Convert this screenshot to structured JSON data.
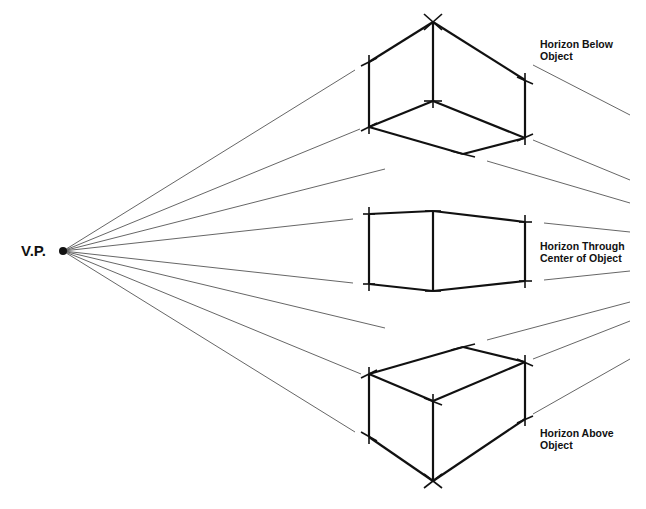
{
  "vanishing_point": {
    "label": "V.P.",
    "x": 63,
    "y": 251
  },
  "colors": {
    "ink": "#111111",
    "guide": "#555555",
    "background": "#ffffff"
  },
  "labels": {
    "top": {
      "line1": "Horizon Below",
      "line2": "Object"
    },
    "middle": {
      "line1": "Horizon Through",
      "line2": "Center of Object"
    },
    "bottom": {
      "line1": "Horizon Above",
      "line2": "Object"
    }
  },
  "objects": [
    {
      "name": "box-horizon-below",
      "edges": [
        [
          369,
          62,
          433,
          22
        ],
        [
          433,
          22,
          525,
          80
        ],
        [
          433,
          22,
          433,
          101
        ],
        [
          369,
          62,
          369,
          127
        ],
        [
          525,
          80,
          525,
          138
        ],
        [
          369,
          127,
          433,
          101
        ],
        [
          433,
          101,
          525,
          138
        ],
        [
          369,
          127,
          463,
          154
        ],
        [
          463,
          154,
          525,
          138
        ]
      ],
      "ticks": [
        [
          424,
          14,
          442,
          30
        ],
        [
          424,
          30,
          442,
          14
        ],
        [
          361,
          66,
          377,
          58
        ],
        [
          369,
          55,
          369,
          69
        ],
        [
          361,
          131,
          377,
          123
        ],
        [
          369,
          120,
          369,
          134
        ],
        [
          424,
          101,
          442,
          101
        ],
        [
          433,
          94,
          433,
          108
        ],
        [
          517,
          77,
          533,
          84
        ],
        [
          525,
          73,
          525,
          87
        ],
        [
          517,
          141,
          533,
          134
        ],
        [
          525,
          131,
          525,
          145
        ],
        [
          451,
          151,
          475,
          157
        ]
      ]
    },
    {
      "name": "box-horizon-through-center",
      "edges": [
        [
          369,
          214,
          433,
          211
        ],
        [
          433,
          211,
          525,
          222
        ],
        [
          369,
          284,
          433,
          291
        ],
        [
          433,
          291,
          525,
          281
        ],
        [
          369,
          214,
          369,
          284
        ],
        [
          433,
          211,
          433,
          291
        ],
        [
          525,
          222,
          525,
          281
        ]
      ],
      "ticks": [
        [
          363,
          214,
          375,
          214
        ],
        [
          369,
          207,
          369,
          221
        ],
        [
          363,
          284,
          375,
          284
        ],
        [
          369,
          277,
          369,
          291
        ],
        [
          425,
          211,
          441,
          211
        ],
        [
          425,
          291,
          441,
          291
        ],
        [
          519,
          222,
          532,
          222
        ],
        [
          525,
          215,
          525,
          229
        ],
        [
          519,
          281,
          532,
          281
        ],
        [
          525,
          274,
          525,
          288
        ]
      ]
    },
    {
      "name": "box-horizon-above",
      "edges": [
        [
          369,
          374,
          463,
          347
        ],
        [
          463,
          347,
          525,
          362
        ],
        [
          369,
          374,
          433,
          401
        ],
        [
          433,
          401,
          525,
          362
        ],
        [
          369,
          374,
          369,
          437
        ],
        [
          433,
          401,
          433,
          481
        ],
        [
          525,
          362,
          525,
          419
        ],
        [
          369,
          437,
          433,
          481
        ],
        [
          433,
          481,
          525,
          419
        ]
      ],
      "ticks": [
        [
          451,
          350,
          475,
          344
        ],
        [
          361,
          378,
          377,
          370
        ],
        [
          369,
          367,
          369,
          381
        ],
        [
          424,
          398,
          442,
          405
        ],
        [
          433,
          394,
          433,
          408
        ],
        [
          517,
          359,
          533,
          366
        ],
        [
          525,
          355,
          525,
          369
        ],
        [
          361,
          432,
          377,
          441
        ],
        [
          369,
          430,
          369,
          444
        ],
        [
          424,
          474,
          442,
          488
        ],
        [
          424,
          488,
          442,
          474
        ],
        [
          517,
          423,
          533,
          416
        ],
        [
          525,
          412,
          525,
          426
        ]
      ]
    }
  ],
  "guide_lines": [
    [
      63,
      251,
      355,
      70
    ],
    [
      63,
      251,
      360,
      129
    ],
    [
      63,
      251,
      385,
      169
    ],
    [
      63,
      251,
      353,
      219
    ],
    [
      63,
      251,
      353,
      283
    ],
    [
      63,
      251,
      385,
      328
    ],
    [
      63,
      251,
      361,
      374
    ],
    [
      63,
      251,
      355,
      432
    ],
    [
      533,
      65,
      630,
      115
    ],
    [
      533,
      140,
      630,
      180
    ],
    [
      487,
      161,
      630,
      203
    ],
    [
      544,
      223,
      630,
      232
    ],
    [
      544,
      280,
      630,
      271
    ],
    [
      487,
      340,
      630,
      302
    ],
    [
      533,
      359,
      630,
      321
    ],
    [
      533,
      414,
      630,
      359
    ]
  ]
}
